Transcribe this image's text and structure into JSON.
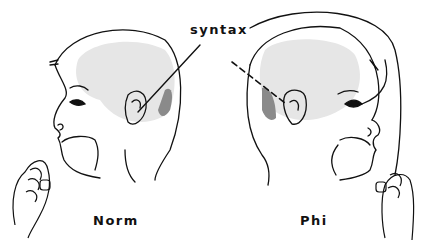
{
  "diagram": {
    "title_label": "syntax",
    "left_label": "Norm",
    "right_label": "Phi",
    "colors": {
      "ink": "#111111",
      "brain_shade": "#e6e6e6",
      "region_shade": "#8a8a8a"
    }
  }
}
